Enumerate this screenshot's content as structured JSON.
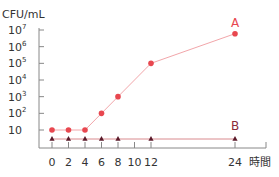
{
  "chart_data": {
    "type": "line",
    "title": "",
    "ylabel": "CFU/mL",
    "xlabel": "時間",
    "yscale": "log",
    "ylim": [
      1,
      10000000
    ],
    "y_ticks": [
      "10",
      "10²",
      "10³",
      "10⁴",
      "10⁵",
      "10⁶",
      "10⁷"
    ],
    "x_ticks": [
      "0",
      "2",
      "4",
      "6",
      "8",
      "10",
      "12",
      "24"
    ],
    "x_tick_values": [
      0,
      2,
      4,
      6,
      8,
      10,
      12,
      24
    ],
    "x_unit_label": "時間",
    "series": [
      {
        "name": "A",
        "color": "#e8474f",
        "marker": "circle",
        "x": [
          0,
          2,
          4,
          6,
          8,
          12,
          24
        ],
        "values": [
          10,
          10,
          10,
          100,
          1000,
          100000,
          6000000
        ]
      },
      {
        "name": "B",
        "color": "#5a1a2a",
        "line_color": "#d98a8e",
        "marker": "triangle",
        "x": [
          0,
          2,
          4,
          6,
          8,
          12,
          24
        ],
        "values": [
          3,
          3,
          3,
          3,
          3,
          3,
          3
        ]
      }
    ],
    "grid": false,
    "legend": "inline labels A and B at line ends"
  }
}
